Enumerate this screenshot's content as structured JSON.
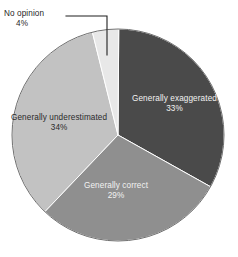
{
  "chart_data": {
    "type": "pie",
    "title": "",
    "subtitle": "",
    "xlabel": "",
    "ylabel": "",
    "legend_position": "none",
    "grid": false,
    "value_suffix": "%",
    "categories": [
      "No opinion",
      "Generally exaggerated",
      "Generally correct",
      "Generally underestimated"
    ],
    "values": [
      4,
      33,
      29,
      34
    ],
    "slices": [
      {
        "label": "No opinion",
        "value": 4,
        "value_text": "4%",
        "color": "#e8e8e8",
        "text_color": "#1f1f1f",
        "label_placement": "outside-leader",
        "start_angle": -14,
        "end_angle": 0
      },
      {
        "label": "Generally exaggerated",
        "value": 33,
        "value_text": "33%",
        "color": "#4a4a4a",
        "text_color": "#f2f2f2",
        "label_placement": "inside",
        "start_angle": 0,
        "end_angle": 118.8
      },
      {
        "label": "Generally correct",
        "value": 29,
        "value_text": "29%",
        "color": "#8f8f8f",
        "text_color": "#f2f2f2",
        "label_placement": "inside",
        "start_angle": 118.8,
        "end_angle": 223.2
      },
      {
        "label": "Generally underestimated",
        "value": 34,
        "value_text": "34%",
        "color": "#c2c2c2",
        "text_color": "#2b2b2b",
        "label_placement": "inside",
        "start_angle": 223.2,
        "end_angle": 346
      }
    ],
    "geometry": {
      "center_x": 118,
      "center_y": 135,
      "radius": 106,
      "start_angle_offset": -14
    },
    "style": {
      "background": "#ffffff",
      "slice_border_color": "#ffffff",
      "slice_border_width": 1,
      "outline_color": "#6e6e6e",
      "leader_line_color": "#1f1f1f"
    }
  }
}
